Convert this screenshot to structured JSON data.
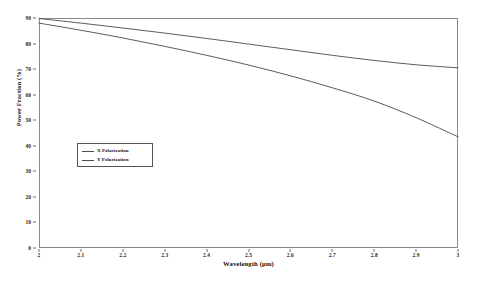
{
  "chart_data": {
    "type": "line",
    "title": "",
    "xlabel": "Wavelength (μm)",
    "ylabel": "Power Fraction (%)",
    "xlim": [
      2,
      3
    ],
    "ylim": [
      0,
      90
    ],
    "grid": false,
    "legend_position": "center-left",
    "xticks": [
      "2",
      "2.1",
      "2.2",
      "2.3",
      "2.4",
      "2.5",
      "2.6",
      "2.7",
      "2.8",
      "2.9",
      "3"
    ],
    "xtick_values": [
      2,
      2.1,
      2.2,
      2.3,
      2.4,
      2.5,
      2.6,
      2.7,
      2.8,
      2.9,
      3
    ],
    "yticks": [
      "0",
      "10",
      "20",
      "30",
      "40",
      "50",
      "60",
      "70",
      "80",
      "90"
    ],
    "ytick_values": [
      0,
      10,
      20,
      30,
      40,
      50,
      60,
      70,
      80,
      90
    ],
    "x": [
      2,
      2.1,
      2.2,
      2.3,
      2.4,
      2.5,
      2.6,
      2.7,
      2.8,
      2.9,
      3
    ],
    "series": [
      {
        "name": "X Polarization",
        "color": "#4a4a4a",
        "values": [
          89.8,
          88.0,
          86.1,
          84.1,
          82.0,
          79.8,
          77.6,
          75.4,
          73.4,
          71.7,
          70.5
        ]
      },
      {
        "name": "Y Polarization",
        "color": "#4a4a4a",
        "values": [
          88.0,
          85.2,
          82.2,
          78.9,
          75.4,
          71.6,
          67.4,
          62.7,
          57.5,
          51.0,
          43.5
        ]
      }
    ]
  },
  "legend": {
    "entries": [
      {
        "label": "X Polarization"
      },
      {
        "label": "Y Polarization"
      }
    ]
  },
  "colors": {
    "line": "#4a4a4a",
    "frame": "#8a8a8a",
    "text": "#101010",
    "background": "#ffffff"
  }
}
